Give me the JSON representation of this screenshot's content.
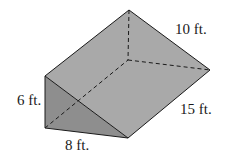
{
  "diagram": {
    "type": "triangular-prism",
    "labels": {
      "height": "6 ft.",
      "base": "8 ft.",
      "length": "15 ft.",
      "slant": "10 ft."
    },
    "colors": {
      "background": "#ffffff",
      "front_face": "#8e8e8e",
      "top_face": "#a9a9a9",
      "edge": "#1a1a1a"
    }
  }
}
